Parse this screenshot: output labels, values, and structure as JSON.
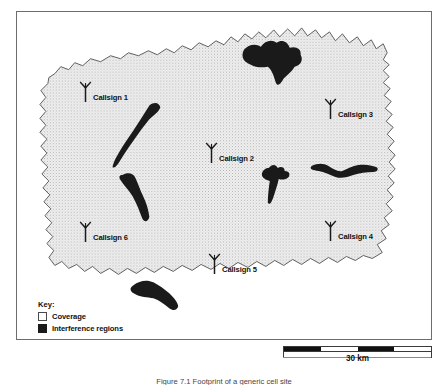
{
  "figure": {
    "caption": "Figure 7.1 Footprint of a generic cell site"
  },
  "map": {
    "coverage_fill": "#ededed",
    "coverage_stipple": "#b9b9b9",
    "coverage_outline": "#4f4f4f",
    "interference_fill": "#1a1a1a",
    "frame_color": "#6d6d6d",
    "background": "#ffffff"
  },
  "sites": [
    {
      "label": "Callsign 1",
      "icon": "antenna-icon",
      "x": 78,
      "y": 80
    },
    {
      "label": "Callsign 3",
      "icon": "antenna-icon",
      "x": 323,
      "y": 97
    },
    {
      "label": "Callsign 2",
      "icon": "antenna-icon",
      "x": 204,
      "y": 141
    },
    {
      "label": "Callsign 4",
      "icon": "antenna-icon",
      "x": 323,
      "y": 219
    },
    {
      "label": "Callsign 6",
      "icon": "antenna-icon",
      "x": 78,
      "y": 220
    },
    {
      "label": "Callsign 5",
      "icon": "antenna-icon",
      "x": 207,
      "y": 252
    }
  ],
  "legend": {
    "title": "Key:",
    "items": [
      {
        "label": "Coverage",
        "swatch": "coverage",
        "color": "#ffffff"
      },
      {
        "label": "Interference regions",
        "swatch": "interference",
        "color": "#1a1a1a"
      }
    ]
  },
  "scale": {
    "label": "30 km",
    "segments": [
      "dark",
      "light",
      "dark",
      "light"
    ]
  }
}
